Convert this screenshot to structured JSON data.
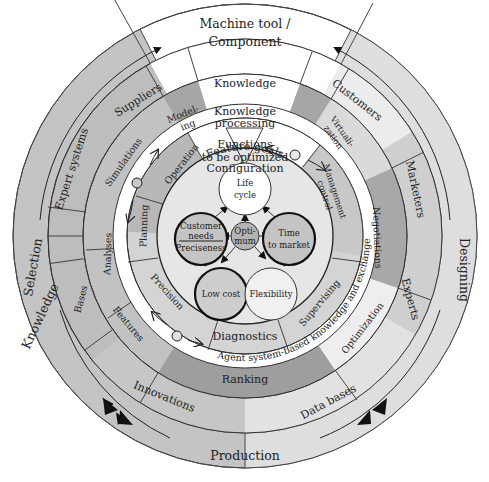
{
  "diagram": {
    "title": "Machine tool / Component",
    "colors": {
      "background": "#ffffff",
      "outer_band": "#c8c8c8",
      "outer_band_right": "#e4e4e4",
      "top_segment": "#ffffff",
      "mid_gray": "#b4b4b4",
      "dark_gray": "#9c9c9c",
      "light_gray": "#dcdcdc",
      "lightest": "#eeeeee",
      "stroke": "#333333",
      "bold_circle_stroke": "#111111"
    },
    "top_stack": {
      "title_line1": "Machine tool /",
      "title_line2": "Component",
      "knowledge": "Knowledge",
      "knowledge_processing_line1": "Knowledge",
      "knowledge_processing_line2": "processing",
      "functions": "Functions",
      "to_be_optimized": "to be optimized",
      "configuration": "Configuration",
      "feature_goals": "Feature goals"
    },
    "outer_ring": {
      "left_label_1": "Knowledge",
      "left_label_2": "Selection",
      "right_label": "Designing",
      "bottom_label": "Production"
    },
    "ring_2": {
      "left_top": "Suppliers",
      "left_upper": "Expert systems",
      "left_lower": "Bases",
      "bottom_left": "Innovations",
      "bottom_right": "Data bases",
      "right_lower": "Experts",
      "right_upper": "Marketers",
      "right_top": "Customers"
    },
    "ring_3": {
      "modeling_line1": "Model-",
      "modeling_line2": "ing",
      "simulations": "Simulations",
      "analyses": "Analyses",
      "features": "Features",
      "ranking": "Ranking",
      "optimization": "Optimization",
      "negotiations": "Negotiations",
      "virtualization_line1": "Virtuali-",
      "virtualization_line2": "zation"
    },
    "agent_band": {
      "label": "Agent system-based knowledge and exchange"
    },
    "ring_4": {
      "operation": "Operation",
      "planning": "Planning",
      "precision": "Precision",
      "diagnostics": "Diagnostics",
      "supervising": "Supervising",
      "management_control_line1": "Management",
      "management_control_line2": "control"
    },
    "core": {
      "life_cycle_line1": "Life",
      "life_cycle_line2": "cycle",
      "customer_needs_line1": "Customer",
      "customer_needs_line2": "needs",
      "preciseness": "Preciseness",
      "optimum_line1": "Opti-",
      "optimum_line2": "mum",
      "time_to_market_line1": "Time",
      "time_to_market_line2": "to market",
      "low_cost": "Low cost",
      "flexibility": "Flexibility"
    }
  }
}
